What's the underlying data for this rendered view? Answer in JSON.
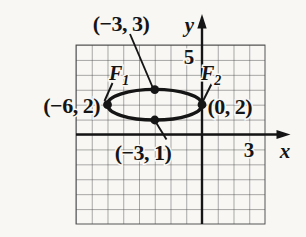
{
  "figure": {
    "type": "ellipse-graph",
    "axes": {
      "x_label": "x",
      "y_label": "y",
      "x_tick": "3",
      "y_tick": "5"
    },
    "points": [
      {
        "name": "top-covertex",
        "label": "(−3, 3)",
        "coords": [
          -3,
          3
        ]
      },
      {
        "name": "left-vertex",
        "label": "(−6, 2)",
        "coords": [
          -6,
          2
        ]
      },
      {
        "name": "right-vertex",
        "label": "(0, 2)",
        "coords": [
          0,
          2
        ]
      },
      {
        "name": "bottom-covertex",
        "label": "(−3, 1)",
        "coords": [
          -3,
          1
        ]
      }
    ],
    "foci": [
      {
        "name": "focus-1",
        "label_main": "F",
        "label_sub": "1"
      },
      {
        "name": "focus-2",
        "label_main": "F",
        "label_sub": "2"
      }
    ],
    "colors": {
      "ink": "#151515",
      "grid_line": "#4d4d4d",
      "paper": "#f8f7f4"
    }
  }
}
